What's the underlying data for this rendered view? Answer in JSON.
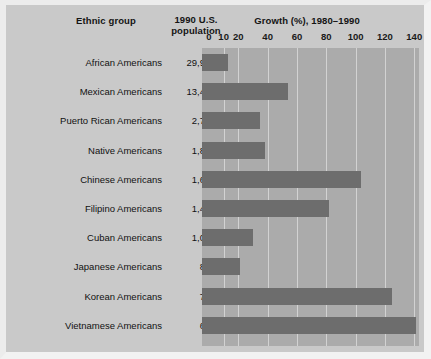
{
  "figure": {
    "columns": {
      "ethnic_group_header": "Ethnic group",
      "population_header_line1": "1990 U.S.",
      "population_header_line2": "population",
      "growth_header": "Growth (%), 1980–1990"
    },
    "colors": {
      "page_background": "#cfcfcf",
      "plot_background": "#ababab",
      "bar": "#6d6d6d",
      "gridline": "#d2d2d2",
      "text": "#111111"
    }
  },
  "chart_data": {
    "type": "bar",
    "orientation": "horizontal",
    "title": "Growth (%), 1980–1990",
    "xlabel": "Growth (%), 1980–1990",
    "ylabel": "Ethnic group",
    "grid": true,
    "legend": "none",
    "xlim": [
      0,
      148
    ],
    "xticks": [
      0,
      10,
      20,
      40,
      60,
      80,
      100,
      120,
      140
    ],
    "xtick_labels": [
      "0",
      "10",
      "20",
      "40",
      "60",
      "80",
      "100",
      "120",
      "140"
    ],
    "categories": [
      "African Americans",
      "Mexican Americans",
      "Puerto Rican Americans",
      "Native Americans",
      "Chinese Americans",
      "Filipino Americans",
      "Cuban Americans",
      "Japanese Americans",
      "Korean Americans",
      "Vietnamese Americans"
    ],
    "values": [
      13,
      54,
      35,
      38,
      104,
      82,
      30,
      21,
      125,
      141
    ],
    "population_labels": [
      "29,986,060",
      "13,495,938",
      "2,727,754",
      "1,878,285",
      "1,645,472",
      "1,406,770",
      "1,043,932",
      "847,562",
      "798,849",
      "614,547"
    ],
    "population_values": [
      29986060,
      13495938,
      2727754,
      1878285,
      1645472,
      1406770,
      1043932,
      847562,
      798849,
      614547
    ]
  }
}
